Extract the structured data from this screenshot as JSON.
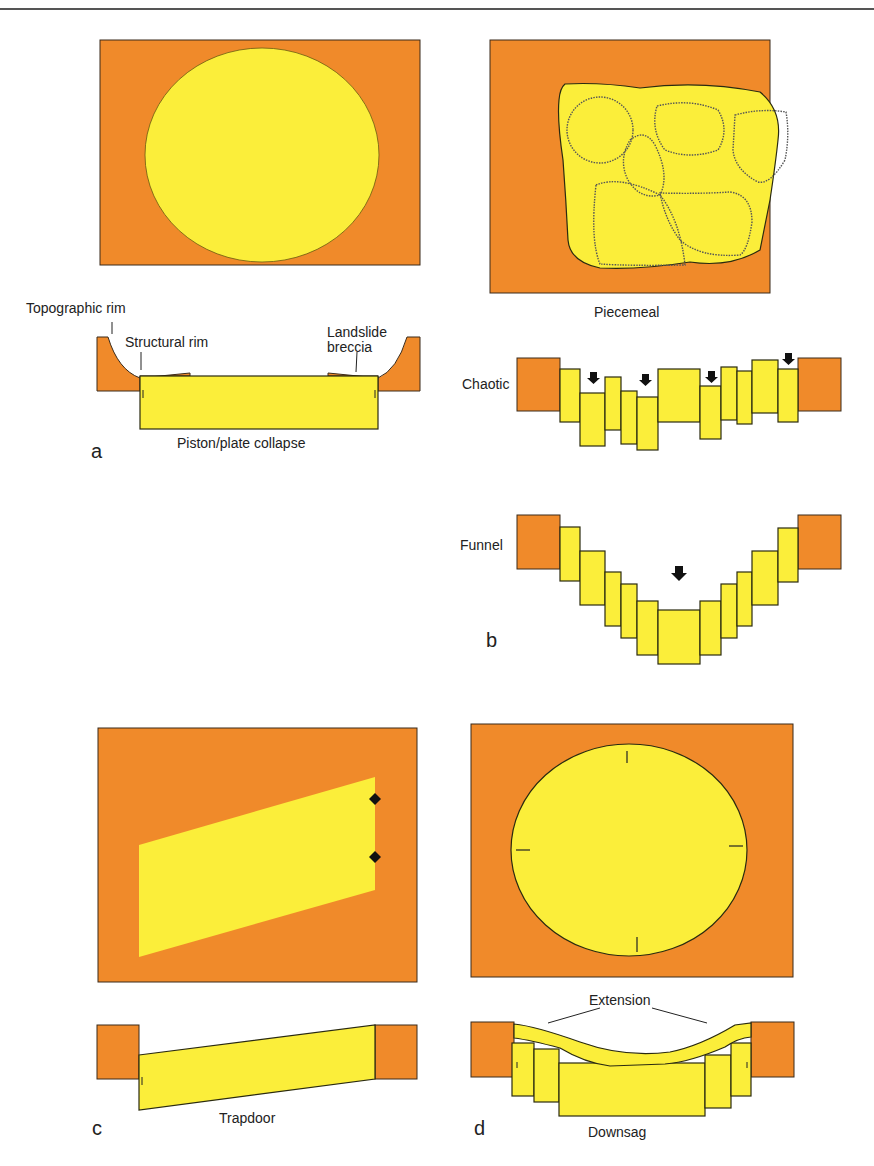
{
  "figure": {
    "type": "geological caldera collapse styles diagram",
    "colors": {
      "country_rock": "#f08a2a",
      "collapse_block": "#fbee3a",
      "outline": "#2a2a10"
    }
  },
  "panels": {
    "a": {
      "letter": "a",
      "title": "Piston/plate collapse",
      "labels": {
        "topographic_rim": "Topographic rim",
        "structural_rim": "Structural rim",
        "landslide_breccia_1": "Landslide",
        "landslide_breccia_2": "breccia"
      }
    },
    "b": {
      "letter": "b",
      "title": "Piecemeal",
      "sections": {
        "chaotic": "Chaotic",
        "funnel": "Funnel"
      }
    },
    "c": {
      "letter": "c",
      "title": "Trapdoor"
    },
    "d": {
      "letter": "d",
      "title": "Downsag",
      "labels": {
        "extension": "Extension"
      }
    }
  }
}
